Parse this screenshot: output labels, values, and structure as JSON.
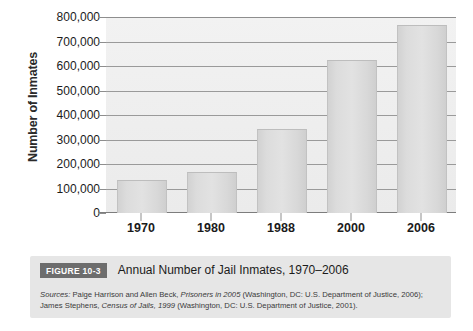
{
  "chart_data": {
    "type": "bar",
    "xlabel": "",
    "ylabel": "Number of Inmates",
    "categories": [
      "1970",
      "1980",
      "1988",
      "2000",
      "2006"
    ],
    "values": [
      130000,
      165000,
      340000,
      620000,
      765000
    ],
    "ylim": [
      0,
      800000
    ],
    "ytick_values": [
      0,
      100000,
      200000,
      300000,
      400000,
      500000,
      600000,
      700000,
      800000
    ],
    "ytick_labels": [
      "0",
      "100,000",
      "200,000",
      "300,000",
      "400,000",
      "500,000",
      "600,000",
      "700,000",
      "800,000"
    ],
    "grid": true,
    "legend": false,
    "bar_color": "#dcdcdc",
    "plot_background": "#efefef",
    "gridline_color": "#9a9a9a"
  },
  "caption": {
    "figure_label": "FIGURE 10-3",
    "title": "Annual Number of Jail Inmates, 1970–2006",
    "sources_lead": "Sources:",
    "sources_line1_a": " Paige Harrison and Allen Beck, ",
    "sources_line1_italic": "Prisoners in 2005",
    "sources_line1_b": " (Washington, DC: U.S. Department of Justice, 2006); James Stephens, ",
    "sources_line2_italic": "Census of Jails, 1999",
    "sources_line2_b": " (Washington, DC: U.S. Department of Justice, 2001).",
    "badge_color": "#6d6d6d",
    "box_color": "#e6e6e6"
  }
}
